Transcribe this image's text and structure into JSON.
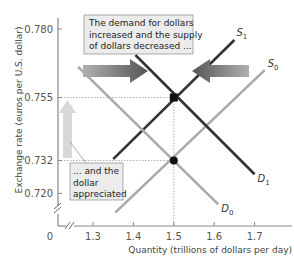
{
  "chart_data": {
    "type": "line",
    "title": "",
    "xlabel": "Quantity (trillions of dollars per day)",
    "ylabel": "Exchange rate (euros per U.S. dollar)",
    "xlim": [
      1.25,
      1.78
    ],
    "ylim": [
      0.705,
      0.785
    ],
    "x_origin_label": "0",
    "x_ticks": [
      1.3,
      1.4,
      1.5,
      1.6,
      1.7
    ],
    "x_tick_labels": [
      "1.3",
      "1.4",
      "1.5",
      "1.6",
      "1.7"
    ],
    "y_ticks": [
      0.72,
      0.732,
      0.755,
      0.78
    ],
    "y_tick_labels": [
      "0.720",
      "0.732",
      "0.755",
      "0.780"
    ],
    "axis_breaks": true,
    "grid": false,
    "series": [
      {
        "name": "S0",
        "label": "S",
        "sub": "0",
        "shade": "light",
        "points": [
          [
            1.355,
            0.713
          ],
          [
            1.725,
            0.765
          ]
        ]
      },
      {
        "name": "S1",
        "label": "S",
        "sub": "1",
        "shade": "dark",
        "points": [
          [
            1.35,
            0.7325
          ],
          [
            1.65,
            0.776
          ]
        ]
      },
      {
        "name": "D0",
        "label": "D",
        "sub": "0",
        "shade": "light",
        "points": [
          [
            1.263,
            0.7662
          ],
          [
            1.61,
            0.716
          ]
        ]
      },
      {
        "name": "D1",
        "label": "D",
        "sub": "1",
        "shade": "dark",
        "points": [
          [
            1.405,
            0.7705
          ],
          [
            1.7,
            0.727
          ]
        ]
      }
    ],
    "equilibria": [
      {
        "name": "initial",
        "x": 1.5,
        "y": 0.732
      },
      {
        "name": "new",
        "x": 1.5,
        "y": 0.755
      }
    ],
    "annotations": [
      {
        "id": "shift",
        "text_lines": [
          "The demand for dollars",
          "increased and the supply",
          "of dollars decreased ..."
        ]
      },
      {
        "id": "appreciate",
        "text_lines": [
          "... and the",
          "dollar",
          "appreciated"
        ]
      }
    ],
    "arrows": [
      {
        "id": "demand-shift-arrow",
        "direction": "right"
      },
      {
        "id": "supply-shift-arrow",
        "direction": "left"
      },
      {
        "id": "appreciation-arrow",
        "direction": "up"
      }
    ],
    "colors": {
      "light_curve": "#aaaaaa",
      "dark_curve": "#333333",
      "shift_arrow": "#666666",
      "up_arrow": "#d8d8d8",
      "note_bg": "#ececec",
      "note_border": "#999999",
      "axis": "#888888"
    }
  }
}
